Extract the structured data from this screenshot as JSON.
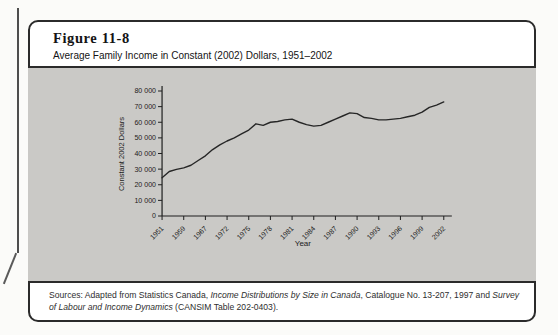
{
  "figure": {
    "label": "Figure 11-8",
    "title": "Average Family Income in Constant (2002) Dollars, 1951–2002"
  },
  "sources": {
    "part1": "Sources: Adapted from Statistics Canada, ",
    "italic1": "Income Distributions by Size in Canada",
    "part2": ", Catalogue No. 13-207, 1997 and ",
    "italic2": "Survey of Labour and Income Dynamics",
    "part3": " (CANSIM Table 202-0403)."
  },
  "chart_data": {
    "type": "line",
    "title": "Average Family Income in Constant (2002) Dollars, 1951–2002",
    "xlabel": "Year",
    "ylabel": "Constant 2002 Dollars",
    "x": [
      1951,
      1954,
      1957,
      1959,
      1961,
      1965,
      1967,
      1969,
      1971,
      1972,
      1973,
      1974,
      1975,
      1976,
      1977,
      1978,
      1979,
      1980,
      1981,
      1982,
      1983,
      1984,
      1985,
      1986,
      1987,
      1988,
      1989,
      1990,
      1991,
      1992,
      1993,
      1994,
      1995,
      1996,
      1997,
      1998,
      1999,
      2000,
      2001,
      2002
    ],
    "values": [
      24500,
      28500,
      29800,
      30800,
      32500,
      35500,
      38500,
      42500,
      45500,
      48000,
      50000,
      52500,
      55000,
      59000,
      58000,
      60000,
      60500,
      61500,
      62000,
      60000,
      58500,
      57500,
      58000,
      60000,
      62000,
      64000,
      66000,
      65500,
      63000,
      62500,
      61500,
      61500,
      62000,
      62500,
      63500,
      64500,
      66500,
      69500,
      71000,
      73000
    ],
    "x_tick_labels": [
      "1951",
      "1959",
      "1967",
      "1972",
      "1975",
      "1978",
      "1981",
      "1984",
      "1987",
      "1990",
      "1993",
      "1996",
      "1999",
      "2002"
    ],
    "x_tick_every": 3,
    "y_tick_labels": [
      "0",
      "10 000",
      "20 000",
      "30 000",
      "40 000",
      "50 000",
      "60 000",
      "70 000",
      "80 000"
    ],
    "y_tick_step": 10000,
    "ylim": [
      0,
      80000
    ],
    "grid": false,
    "legend": "none",
    "line_color": "#262626",
    "axis_color": "#1f1f1f",
    "panel_color": "#cac9c6",
    "label_color": "#1c1c1c"
  }
}
